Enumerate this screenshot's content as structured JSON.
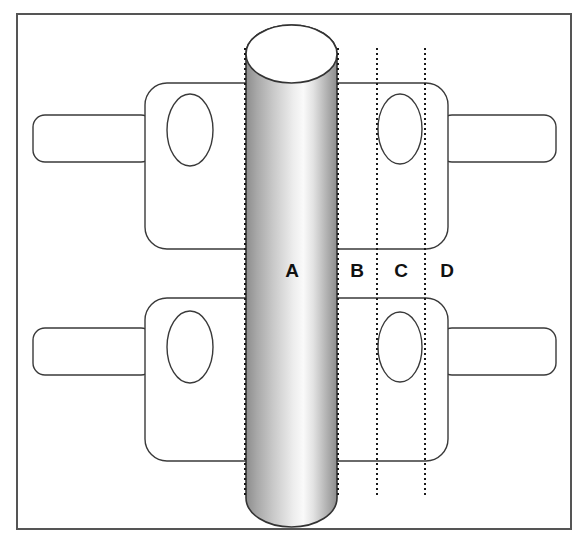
{
  "figure": {
    "canvas": {
      "width": 588,
      "height": 543
    },
    "background_color": "#ffffff",
    "frame": {
      "name": "outer-frame",
      "x": 17,
      "y": 14,
      "width": 554,
      "height": 515,
      "stroke": "#555555",
      "stroke_width": 2,
      "fill": "#ffffff"
    },
    "cylinder": {
      "name": "vertical-cylinder",
      "left": 246,
      "right": 337,
      "top": 25,
      "bottom": 527,
      "cap_ry": 29,
      "stroke": "#333333",
      "stroke_width": 1.6,
      "gradient_stops": [
        {
          "offset": "0%",
          "color": "#8d8d8d"
        },
        {
          "offset": "12%",
          "color": "#a8a8a8"
        },
        {
          "offset": "30%",
          "color": "#c9c9c9"
        },
        {
          "offset": "52%",
          "color": "#ededed"
        },
        {
          "offset": "63%",
          "color": "#fafafa"
        },
        {
          "offset": "74%",
          "color": "#e2e2e2"
        },
        {
          "offset": "88%",
          "color": "#b4b4b4"
        },
        {
          "offset": "100%",
          "color": "#8d8d8d"
        }
      ],
      "cap_fill": "#ffffff"
    },
    "dotted_lines": [
      {
        "name": "boundary-line-1",
        "x": 245,
        "y1": 48,
        "y2": 497
      },
      {
        "name": "boundary-line-2",
        "x": 338,
        "y1": 48,
        "y2": 497
      },
      {
        "name": "boundary-line-3",
        "x": 377,
        "y1": 48,
        "y2": 497
      },
      {
        "name": "boundary-line-4",
        "x": 425,
        "y1": 48,
        "y2": 497
      }
    ],
    "dotted_line_style": {
      "stroke": "#1a1a1a",
      "stroke_width": 2,
      "dash": "2 3"
    },
    "zone_labels": [
      {
        "name": "zone-label-a",
        "text": "A",
        "x": 292,
        "y": 272
      },
      {
        "name": "zone-label-b",
        "text": "B",
        "x": 357,
        "y": 272
      },
      {
        "name": "zone-label-c",
        "text": "C",
        "x": 401,
        "y": 272
      },
      {
        "name": "zone-label-d",
        "text": "D",
        "x": 447,
        "y": 272
      }
    ],
    "blocks": [
      {
        "name": "block-upper-left",
        "body": {
          "x": 145,
          "y": 83,
          "width": 152,
          "height": 166,
          "rx": 22
        },
        "tab": {
          "x": 33,
          "y": 115,
          "width": 120,
          "height": 47,
          "rx": 12
        },
        "hole": {
          "cx": 190,
          "cy": 130,
          "rx": 23,
          "ry": 36
        }
      },
      {
        "name": "block-upper-right",
        "body": {
          "x": 295,
          "y": 83,
          "width": 153,
          "height": 166,
          "rx": 22
        },
        "tab": {
          "x": 440,
          "y": 115,
          "width": 116,
          "height": 47,
          "rx": 12
        },
        "hole": {
          "cx": 400,
          "cy": 129,
          "rx": 22,
          "ry": 35
        }
      },
      {
        "name": "block-lower-left",
        "body": {
          "x": 145,
          "y": 298,
          "width": 152,
          "height": 163,
          "rx": 22
        },
        "tab": {
          "x": 33,
          "y": 328,
          "width": 120,
          "height": 47,
          "rx": 12
        },
        "hole": {
          "cx": 190,
          "cy": 347,
          "rx": 23,
          "ry": 36
        }
      },
      {
        "name": "block-lower-right",
        "body": {
          "x": 295,
          "y": 298,
          "width": 153,
          "height": 163,
          "rx": 22
        },
        "tab": {
          "x": 440,
          "y": 328,
          "width": 116,
          "height": 47,
          "rx": 12
        },
        "hole": {
          "cx": 400,
          "cy": 347,
          "rx": 22,
          "ry": 35
        }
      }
    ],
    "block_style": {
      "stroke": "#3a3a3a",
      "stroke_width": 1.4,
      "fill": "#ffffff"
    }
  }
}
